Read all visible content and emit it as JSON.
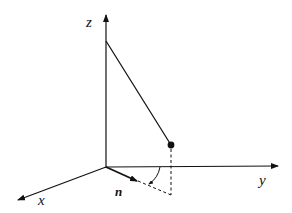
{
  "diagram": {
    "type": "3d-axes-pendulum",
    "labels": {
      "z_axis": "z",
      "y_axis": "y",
      "x_axis": "x",
      "normal_vector": "n"
    },
    "colors": {
      "stroke": "#111111",
      "background": "#ffffff"
    }
  }
}
